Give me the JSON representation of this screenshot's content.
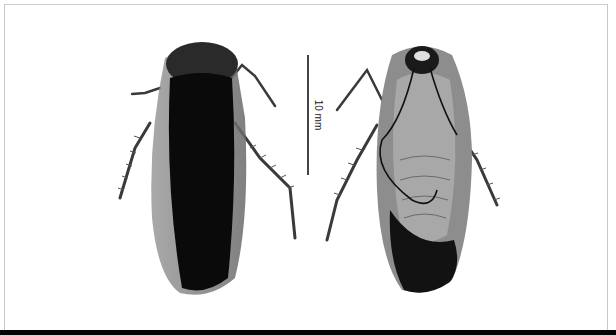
{
  "figure": {
    "type": "specimen-photograph",
    "views": [
      {
        "id": "dorsal",
        "label": "dorsal view"
      },
      {
        "id": "ventral",
        "label": "ventral view"
      }
    ],
    "scale_bar": {
      "label": "10 mm",
      "orientation": "vertical"
    },
    "colors": {
      "background": "#ffffff",
      "frame": "#c8c8c8",
      "bottom_bar": "#050505",
      "specimen_dark": "#0a0a0a",
      "specimen_wing": "#8a8a8a"
    }
  }
}
